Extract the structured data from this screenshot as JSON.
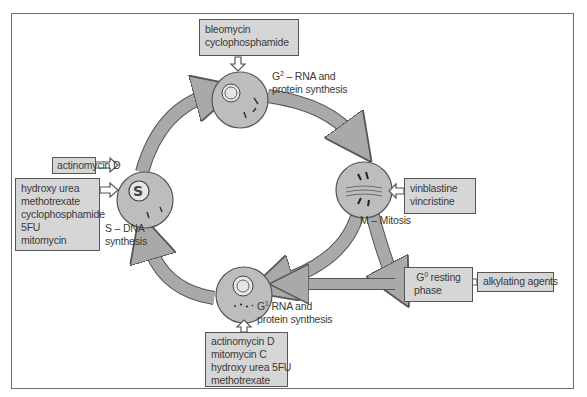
{
  "diagram": {
    "type": "cell-cycle",
    "colors": {
      "arrow_fill": "#a9a9a9",
      "cell_fill": "#bdbdbd",
      "box_fill": "#d6d6d6",
      "outline": "#555555",
      "text": "#3a3a3a"
    },
    "phases": {
      "g2": {
        "prefix": "G",
        "sup": "2",
        "line1_rest": " – RNA and",
        "line2": "protein synthesis"
      },
      "s": {
        "line1": "S – DNA",
        "line2": "synthesis"
      },
      "m": {
        "label": "M – Mitosis"
      },
      "g1": {
        "prefix": "G",
        "sup": "1",
        "line1_rest": " RNA and",
        "line2": "protein synthesis"
      },
      "g0": {
        "prefix": "G",
        "sup": "0",
        "line1_rest": " resting",
        "line2": "phase"
      }
    },
    "drug_boxes": {
      "g2": [
        "bleomycin",
        "cyclophosphamide"
      ],
      "s_top": [
        "actinomycin D"
      ],
      "s_main": [
        "hydroxy urea",
        "methotrexate",
        "cyclophosphamide",
        "5FU",
        "mitomycin"
      ],
      "m": [
        "vinblastine",
        "vincristine"
      ],
      "g0": [
        "alkylating agents"
      ],
      "g1": [
        "actinomycin D",
        "mitomycin C",
        "hydroxy urea 5FU",
        "methotrexate"
      ]
    }
  }
}
